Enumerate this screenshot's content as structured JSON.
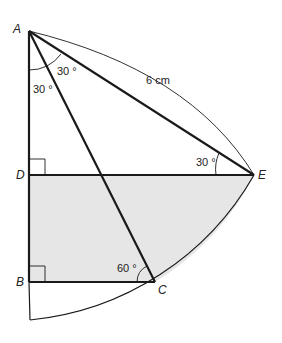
{
  "diagram": {
    "points": {
      "A": "A",
      "B": "B",
      "C": "C",
      "D": "D",
      "E": "E"
    },
    "angles": {
      "angle_A_upper": "30 °",
      "angle_A_lower": "30 °",
      "angle_E": "30 °",
      "angle_C": "60 °"
    },
    "lengths": {
      "arc_AE": "6 cm"
    },
    "colors": {
      "shaded_region": "#e6e6e6",
      "line": "#1a1a1a"
    }
  }
}
